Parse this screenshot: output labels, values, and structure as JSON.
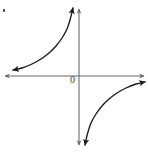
{
  "figure": {
    "title": "",
    "origin_label": "0",
    "background_color": "#ffffff",
    "axis_color": "#6b6b6b",
    "curve_color": "#1a1a1a",
    "label_color": "#3a3a3a",
    "width": 148,
    "height": 153,
    "speck_label": ""
  },
  "chart_data": {
    "type": "line",
    "title": "",
    "subtitle": "",
    "xlabel": "",
    "ylabel": "",
    "grid": false,
    "legend": "none",
    "annotations": [
      "0"
    ],
    "axis_origin_px": {
      "x": 79,
      "y": 76
    },
    "axes": {
      "x_axis": {
        "y_pixel": 76,
        "x_start_pixel": 4,
        "x_end_pixel": 145,
        "arrow_left": true,
        "arrow_right": true
      },
      "y_axis": {
        "x_pixel": 79,
        "y_start_pixel": 8,
        "y_end_pixel": 146,
        "arrow_up": true,
        "arrow_down": true
      }
    },
    "function": "y = -k / x",
    "xlim": [
      -79,
      69
    ],
    "ylim": [
      -77,
      68
    ],
    "series": [
      {
        "name": "branch-quadrant-II",
        "quadrant": 2,
        "arrow_start": true,
        "arrow_end": true,
        "points_px": [
          [
            13,
            70
          ],
          [
            22,
            68
          ],
          [
            32,
            64
          ],
          [
            41,
            59
          ],
          [
            49,
            53
          ],
          [
            56,
            46
          ],
          [
            62,
            38
          ],
          [
            67,
            29
          ],
          [
            70,
            20
          ],
          [
            72,
            12
          ],
          [
            73,
            8
          ]
        ]
      },
      {
        "name": "branch-quadrant-IV",
        "quadrant": 4,
        "arrow_start": true,
        "arrow_end": true,
        "points_px": [
          [
            145,
            82
          ],
          [
            136,
            84
          ],
          [
            126,
            88
          ],
          [
            117,
            93
          ],
          [
            109,
            99
          ],
          [
            102,
            106
          ],
          [
            96,
            114
          ],
          [
            91,
            123
          ],
          [
            88,
            132
          ],
          [
            86,
            140
          ],
          [
            85,
            145
          ]
        ]
      }
    ]
  }
}
